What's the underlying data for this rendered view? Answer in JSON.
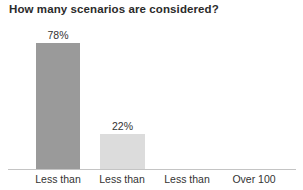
{
  "chart_data": {
    "type": "bar",
    "title": "How many scenarios are considered?",
    "xlabel": "",
    "ylabel": "",
    "ylim": [
      0,
      100
    ],
    "grid": false,
    "legend": null,
    "categories": [
      "Less than",
      "Less than",
      "Less than",
      "Over 100"
    ],
    "values": [
      78,
      22,
      0,
      0
    ],
    "value_labels": [
      "78%",
      "22%",
      "",
      ""
    ],
    "bar_colors": [
      "#9a9a9a",
      "#dcdcdc",
      "#dcdcdc",
      "#dcdcdc"
    ]
  },
  "title": {
    "text": "How many scenarios are considered?"
  },
  "axis": {
    "baseline_color": "#c4c4c4"
  },
  "bars": [
    {
      "category": "Less than",
      "value": 78,
      "label": "78%",
      "color": "#9a9a9a",
      "left": 36,
      "width": 44
    },
    {
      "category": "Less than",
      "value": 22,
      "label": "22%",
      "color": "#dcdcdc",
      "left": 100,
      "width": 45
    },
    {
      "category": "Less than",
      "value": 0,
      "label": "",
      "color": "#dcdcdc",
      "left": 164,
      "width": 45
    },
    {
      "category": "Over 100",
      "value": 0,
      "label": "",
      "color": "#dcdcdc",
      "left": 228,
      "width": 45
    }
  ],
  "category_labels": [
    {
      "text": "Less than",
      "left": 23,
      "width": 70
    },
    {
      "text": "Less than",
      "left": 87,
      "width": 70
    },
    {
      "text": "Less than",
      "left": 152,
      "width": 70
    },
    {
      "text": "Over 100",
      "left": 219,
      "width": 70
    }
  ]
}
